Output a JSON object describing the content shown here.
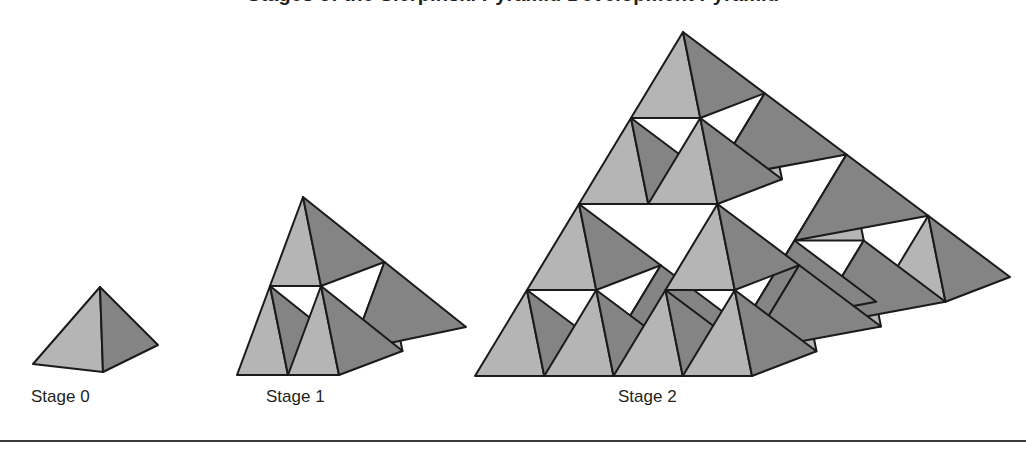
{
  "figure": {
    "title": "Stages of the Sierpinski Pyramid Development Pyramid",
    "background_color": "#ffffff",
    "ink_color": "#231f20"
  },
  "palette": {
    "face_light": "#b5b5b5",
    "face_dark": "#848484",
    "face_void": "#ffffff",
    "outline": "#1a1a1a"
  },
  "stages": [
    {
      "id": "stage-0",
      "caption": "Stage 0",
      "depth": 0,
      "tetrahedra_count": 1,
      "apex": [
        100,
        287
      ],
      "left": [
        33,
        364
      ],
      "right": [
        158,
        345
      ],
      "mid": [
        103,
        372
      ]
    },
    {
      "id": "stage-1",
      "caption": "Stage 1",
      "depth": 1,
      "tetrahedra_count": 4,
      "apex": [
        303,
        197
      ],
      "left": [
        237,
        375
      ],
      "right": [
        466,
        327
      ],
      "mid": [
        339,
        375
      ]
    },
    {
      "id": "stage-2",
      "caption": "Stage 2",
      "depth": 2,
      "tetrahedra_count": 16,
      "apex": [
        683,
        32
      ],
      "left": [
        475,
        376
      ],
      "right": [
        1010,
        277
      ],
      "mid": [
        752,
        376
      ]
    }
  ],
  "rule": {
    "name": "bottom-rule",
    "y": 440,
    "color": "#3b3b3b"
  }
}
